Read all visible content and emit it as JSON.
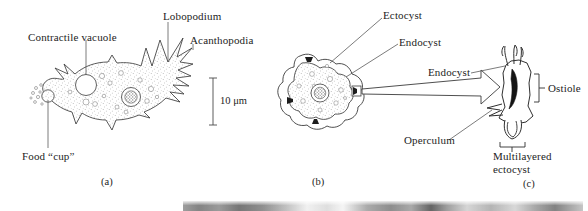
{
  "figure": {
    "title_absent": true,
    "panels": [
      {
        "id": "a",
        "letter": "(a)",
        "subject": "amoeba trophozoite",
        "labels": [
          {
            "name": "contractile-vacuole",
            "text": "Contractile vacuole"
          },
          {
            "name": "lobopodium",
            "text": "Lobopodium"
          },
          {
            "name": "acanthopodia",
            "text": "Acanthopodia"
          },
          {
            "name": "food-cup",
            "text": "Food “cup”"
          }
        ],
        "scale_bar": {
          "text": "10 μm",
          "value": 10,
          "unit": "μm"
        }
      },
      {
        "id": "b",
        "letter": "(b)",
        "subject": "cyst",
        "labels": [
          {
            "name": "ectocyst",
            "text": "Ectocyst"
          },
          {
            "name": "endocyst",
            "text": "Endocyst"
          }
        ]
      },
      {
        "id": "c",
        "letter": "(c)",
        "subject": "ostiole detail",
        "labels": [
          {
            "name": "endocyst",
            "text": "Endocyst"
          },
          {
            "name": "ostiole",
            "text": "Ostiole"
          },
          {
            "name": "operculum",
            "text": "Operculum"
          },
          {
            "name": "multilayered-ectocyst",
            "text": "Multilayered ectocyst"
          }
        ]
      }
    ]
  },
  "colors": {
    "ink": "#1d1d1d",
    "line": "#3a3a3a",
    "cytoplasm_stipple": "#6b6b6b",
    "background": "#ffffff"
  }
}
